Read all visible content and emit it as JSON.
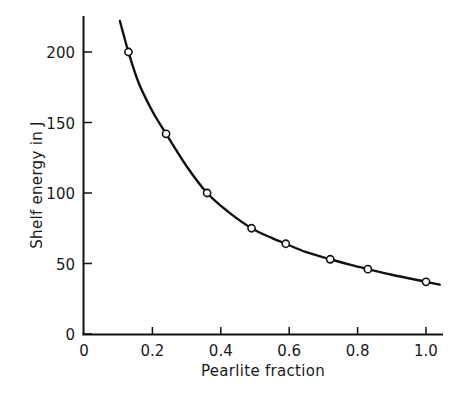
{
  "chart_data": {
    "type": "line",
    "title": "",
    "xlabel": "Pearlite fraction",
    "ylabel": "Shelf energy in J",
    "xlim": [
      0,
      1.05
    ],
    "ylim": [
      0,
      225
    ],
    "x_ticks": [
      0,
      0.2,
      0.4,
      0.6,
      0.8,
      1.0
    ],
    "x_tick_labels": [
      "0",
      "0.2",
      "0.4",
      "0.6",
      "0.8",
      "1.0"
    ],
    "y_ticks": [
      0,
      50,
      100,
      150,
      200
    ],
    "y_tick_labels": [
      "0",
      "50",
      "100",
      "150",
      "200"
    ],
    "grid": false,
    "legend": null,
    "series": [
      {
        "name": "Measured shelf energy",
        "style": "open-circle markers",
        "x": [
          0.13,
          0.24,
          0.36,
          0.49,
          0.59,
          0.72,
          0.83,
          1.0
        ],
        "y": [
          200,
          142,
          100,
          75,
          64,
          53,
          46,
          37
        ]
      },
      {
        "name": "Fitted curve",
        "style": "solid line",
        "x": [
          0.105,
          0.13,
          0.16,
          0.2,
          0.24,
          0.3,
          0.36,
          0.42,
          0.49,
          0.55,
          0.59,
          0.65,
          0.72,
          0.78,
          0.83,
          0.9,
          1.0,
          1.04
        ],
        "y": [
          222,
          200,
          178,
          158,
          142,
          119,
          100,
          87,
          75,
          68,
          64,
          58,
          53,
          49,
          46,
          42,
          37,
          35
        ]
      }
    ]
  },
  "axes": {
    "x_label": "Pearlite fraction",
    "y_label": "Shelf energy in J"
  }
}
